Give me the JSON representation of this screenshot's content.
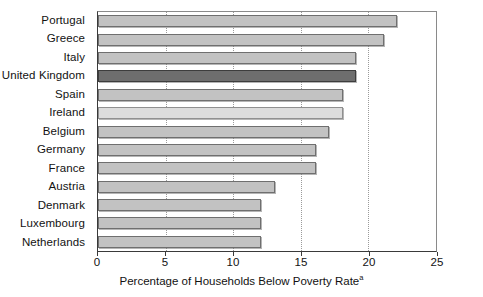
{
  "chart_data": {
    "type": "bar",
    "orientation": "horizontal",
    "title": "",
    "xlabel": "Percentage of Households Below Poverty Rate",
    "xlabel_superscript": "a",
    "ylabel": "",
    "categories": [
      "Portugal",
      "Greece",
      "Italy",
      "United Kingdom",
      "Spain",
      "Ireland",
      "Belgium",
      "Germany",
      "France",
      "Austria",
      "Denmark",
      "Luxembourg",
      "Netherlands"
    ],
    "values": [
      22,
      21,
      19,
      19,
      18,
      18,
      17,
      16,
      16,
      13,
      12,
      12,
      12
    ],
    "xlim": [
      0,
      25
    ],
    "xticks": [
      0,
      5,
      10,
      15,
      20,
      25
    ],
    "xtick_labels": [
      "0",
      "5",
      "10",
      "15",
      "20",
      "25"
    ],
    "grid": "vertical-dotted",
    "legend": "none",
    "bar_colors": {
      "default": "#c2c2c2",
      "highlight_dark": "#6e6e6e",
      "highlight_light": "#dcdcdc",
      "border": "#6f6f6f"
    },
    "highlighted": [
      {
        "category": "United Kingdom",
        "style": "dark"
      },
      {
        "category": "Ireland",
        "style": "light"
      }
    ]
  }
}
